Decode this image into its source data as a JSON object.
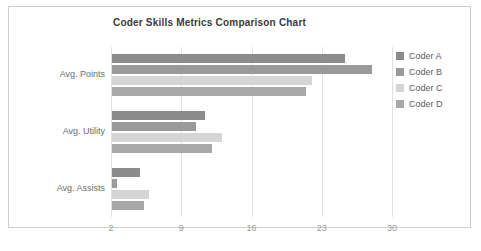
{
  "chart_data": {
    "type": "bar",
    "orientation": "horizontal",
    "title": "Coder Skills Metrics Comparison Chart",
    "xlabel": "",
    "ylabel": "",
    "categories": [
      "Avg. Points",
      "Avg. Utility",
      "Avg. Assists"
    ],
    "series": [
      {
        "name": "Coder A",
        "color": "#8c8c8c",
        "values": [
          25.2,
          11.3,
          4.8
        ]
      },
      {
        "name": "Coder B",
        "color": "#9a9a9a",
        "values": [
          27.9,
          10.4,
          2.5
        ]
      },
      {
        "name": "Coder C",
        "color": "#d5d5d5",
        "values": [
          21.9,
          13.0,
          5.7
        ]
      },
      {
        "name": "Coder D",
        "color": "#a8a8a8",
        "values": [
          21.3,
          12.0,
          5.2
        ]
      }
    ],
    "xticks": [
      2,
      9,
      16,
      23,
      30
    ],
    "xtick_labels": [
      "2",
      "9",
      "16",
      "23",
      "30"
    ],
    "xlim": [
      2,
      30
    ],
    "grid": true,
    "legend_position": "right",
    "legend_entries": [
      "Coder A",
      "Coder B",
      "Coder C",
      "Coder D"
    ]
  },
  "colors": {
    "background": "#ffffff",
    "frame_border": "#cfcfcf",
    "gridline": "#e2e2e2",
    "axis": "#6b6b6b",
    "title_text": "#3b3b3b",
    "tick_text": "#9a9a9a",
    "category_text": "#6d6d6d",
    "legend_text": "#5c5c5c"
  }
}
